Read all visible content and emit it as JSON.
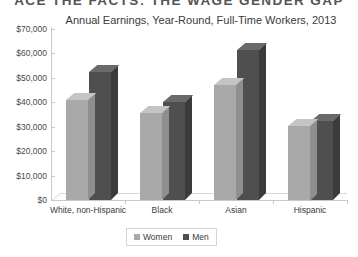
{
  "page_header": "ACE THE FACTS: THE WAGE GENDER GAP",
  "legend": {
    "women_label": "Women",
    "men_label": "Men",
    "women_color": "#a9a9a9",
    "men_color": "#4f4f4f"
  },
  "chart_data": {
    "type": "bar",
    "title": "Annual Earnings, Year-Round, Full-Time Workers, 2013",
    "xlabel": "",
    "ylabel": "",
    "categories": [
      "White, non-Hispanic",
      "Black",
      "Asian",
      "Hispanic"
    ],
    "series": [
      {
        "name": "Women",
        "color": "#a9a9a9",
        "values": [
          41000,
          35500,
          47000,
          30500
        ]
      },
      {
        "name": "Men",
        "color": "#4f4f4f",
        "values": [
          52500,
          40000,
          61500,
          32500
        ]
      }
    ],
    "ylim": [
      0,
      70000
    ],
    "ytick_values": [
      0,
      10000,
      20000,
      30000,
      40000,
      50000,
      60000,
      70000
    ],
    "ytick_labels": [
      "$0",
      "$10,000",
      "$20,000",
      "$30,000",
      "$40,000",
      "$50,000",
      "$60,000",
      "$70,000"
    ],
    "grid": false,
    "legend_position": "bottom",
    "style": "3d-column"
  }
}
